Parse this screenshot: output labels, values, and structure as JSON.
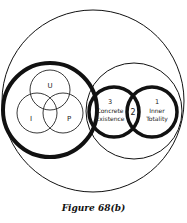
{
  "diagram": {
    "caption": "Figure 68(b)",
    "colors": {
      "stroke": "#111111",
      "background": "#ffffff",
      "text": "#222222"
    },
    "left_group": {
      "circles": [
        {
          "label": "U"
        },
        {
          "label": "I"
        },
        {
          "label": "P"
        }
      ]
    },
    "right_group": {
      "circle_3": {
        "number": "3",
        "line1": "Concrete",
        "line2": "Existence"
      },
      "intersection": {
        "number": "2"
      },
      "circle_1": {
        "number": "1",
        "line1": "Inner",
        "line2": "Totality"
      }
    }
  }
}
